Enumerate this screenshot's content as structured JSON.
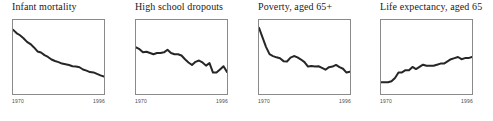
{
  "figure": {
    "panel_count": 4,
    "line_color": "#262626",
    "box_color": "#8a8a8a",
    "background": "#ffffff"
  },
  "chart_data": [
    {
      "type": "line",
      "title": "Infant mortality",
      "xlabel": "",
      "ylabel": "",
      "xlim": [
        1970,
        1996
      ],
      "xticks": [
        1970,
        1996
      ],
      "xticklabels": [
        "1970",
        "1996"
      ],
      "grid": false,
      "legend": "none",
      "x": [
        1970,
        1971,
        1972,
        1973,
        1974,
        1975,
        1976,
        1977,
        1978,
        1979,
        1980,
        1981,
        1982,
        1983,
        1984,
        1985,
        1986,
        1987,
        1988,
        1989,
        1990,
        1991,
        1992,
        1993,
        1994,
        1995,
        1996
      ],
      "values": [
        20.0,
        19.1,
        18.5,
        17.7,
        16.7,
        16.1,
        15.2,
        14.1,
        13.8,
        13.1,
        12.6,
        11.9,
        11.5,
        11.2,
        10.8,
        10.6,
        10.4,
        10.1,
        10.0,
        9.8,
        9.2,
        8.9,
        8.5,
        8.4,
        8.0,
        7.6,
        7.3
      ]
    },
    {
      "type": "line",
      "title": "High school dropouts",
      "xlabel": "",
      "ylabel": "",
      "xlim": [
        1970,
        1996
      ],
      "xticks": [
        1970,
        1996
      ],
      "xticklabels": [
        "1970",
        "1996"
      ],
      "grid": false,
      "legend": "none",
      "x": [
        1970,
        1971,
        1972,
        1973,
        1974,
        1975,
        1976,
        1977,
        1978,
        1979,
        1980,
        1981,
        1982,
        1983,
        1984,
        1985,
        1986,
        1987,
        1988,
        1989,
        1990,
        1991,
        1992,
        1993,
        1994,
        1995,
        1996
      ],
      "values": [
        15.0,
        14.7,
        14.2,
        14.3,
        14.1,
        13.9,
        14.1,
        14.1,
        14.2,
        14.6,
        14.1,
        13.9,
        13.9,
        13.7,
        13.1,
        12.6,
        12.2,
        12.7,
        12.9,
        12.6,
        12.1,
        12.5,
        11.0,
        11.0,
        11.5,
        12.0,
        11.1
      ]
    },
    {
      "type": "line",
      "title": "Poverty, aged 65+",
      "xlabel": "",
      "ylabel": "",
      "xlim": [
        1970,
        1996
      ],
      "xticks": [
        1970,
        1996
      ],
      "xticklabels": [
        "1970",
        "1996"
      ],
      "grid": false,
      "legend": "none",
      "x": [
        1970,
        1971,
        1972,
        1973,
        1974,
        1975,
        1976,
        1977,
        1978,
        1979,
        1980,
        1981,
        1982,
        1983,
        1984,
        1985,
        1986,
        1987,
        1988,
        1989,
        1990,
        1991,
        1992,
        1993,
        1994,
        1995,
        1996
      ],
      "values": [
        24.6,
        21.6,
        18.6,
        16.3,
        15.7,
        15.3,
        15.0,
        14.1,
        14.0,
        15.2,
        15.7,
        15.3,
        14.6,
        13.8,
        12.4,
        12.6,
        12.4,
        12.5,
        12.0,
        11.4,
        12.2,
        12.4,
        12.9,
        12.2,
        11.7,
        10.5,
        10.8
      ]
    },
    {
      "type": "line",
      "title": "Life expectancy, aged 65",
      "xlabel": "",
      "ylabel": "",
      "xlim": [
        1970,
        1996
      ],
      "xticks": [
        1970,
        1996
      ],
      "xticklabels": [
        "1970",
        "1996"
      ],
      "grid": false,
      "legend": "none",
      "x": [
        1970,
        1971,
        1972,
        1973,
        1974,
        1975,
        1976,
        1977,
        1978,
        1979,
        1980,
        1981,
        1982,
        1983,
        1984,
        1985,
        1986,
        1987,
        1988,
        1989,
        1990,
        1991,
        1992,
        1993,
        1994,
        1995,
        1996
      ],
      "values": [
        15.2,
        15.2,
        15.2,
        15.3,
        15.6,
        16.1,
        16.1,
        16.3,
        16.3,
        16.6,
        16.4,
        16.6,
        16.8,
        16.7,
        16.7,
        16.7,
        16.8,
        16.9,
        16.9,
        17.1,
        17.3,
        17.4,
        17.5,
        17.3,
        17.4,
        17.4,
        17.5
      ]
    }
  ]
}
